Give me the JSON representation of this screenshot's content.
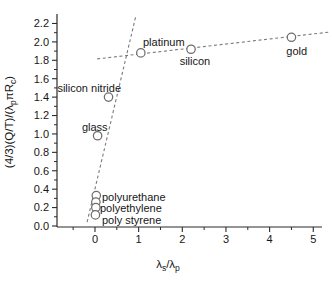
{
  "figure": {
    "background": "#ffffff"
  },
  "chart_data": {
    "type": "scatter",
    "title": "",
    "xlabel_parts": [
      {
        "t": "λ"
      },
      {
        "t": "s",
        "sub": true
      },
      {
        "t": "/λ"
      },
      {
        "t": "p",
        "sub": true
      }
    ],
    "ylabel_parts": [
      {
        "t": "(4/3)(Q/T)/(λ"
      },
      {
        "t": "p",
        "sub": true
      },
      {
        "t": "πR"
      },
      {
        "t": "c",
        "sub": true
      },
      {
        "t": ")"
      }
    ],
    "xlim": [
      -0.87,
      5.2
    ],
    "ylim": [
      -0.011,
      2.303
    ],
    "grid": false,
    "legend": false,
    "x_ticks": [
      {
        "v": 0,
        "label": "0"
      },
      {
        "v": 1,
        "label": "1"
      },
      {
        "v": 2,
        "label": "2"
      },
      {
        "v": 3,
        "label": "3"
      },
      {
        "v": 4,
        "label": "4"
      },
      {
        "v": 5,
        "label": "5"
      }
    ],
    "x_minor_ticks": [
      -0.5,
      0.5,
      1.5,
      2.5,
      3.5,
      4.5
    ],
    "y_ticks": [
      {
        "v": 0.0,
        "label": "0.0"
      },
      {
        "v": 0.2,
        "label": "0.2"
      },
      {
        "v": 0.4,
        "label": "0.4"
      },
      {
        "v": 0.6,
        "label": "0.6"
      },
      {
        "v": 0.8,
        "label": "0.8"
      },
      {
        "v": 1.0,
        "label": "1.0"
      },
      {
        "v": 1.2,
        "label": "1.2"
      },
      {
        "v": 1.4,
        "label": "1.4"
      },
      {
        "v": 1.6,
        "label": "1.6"
      },
      {
        "v": 1.8,
        "label": "1.8"
      },
      {
        "v": 2.0,
        "label": "2.0"
      },
      {
        "v": 2.2,
        "label": "2.2"
      }
    ],
    "y_minor_ticks": [
      0.1,
      0.3,
      0.5,
      0.7,
      0.9,
      1.1,
      1.3,
      1.5,
      1.7,
      1.9,
      2.1
    ],
    "points": [
      {
        "label": "platinum",
        "x": 1.05,
        "y": 1.88
      },
      {
        "label": "silicon",
        "x": 2.2,
        "y": 1.92
      },
      {
        "label": "gold",
        "x": 4.5,
        "y": 2.05
      },
      {
        "label": "silicon nitride",
        "x": 0.31,
        "y": 1.4
      },
      {
        "label": "glass",
        "x": 0.06,
        "y": 0.98
      },
      {
        "label": "polyurethane",
        "x": 0.03,
        "y": 0.33
      },
      {
        "label": "polyethylene",
        "x": 0.02,
        "y": 0.26
      },
      {
        "label": "polyethylene",
        "x": 0.02,
        "y": 0.2
      },
      {
        "label": "poly styrene",
        "x": 0.01,
        "y": 0.12
      }
    ],
    "annotations": [
      {
        "text": "platinum",
        "x": 1.1,
        "y": 1.956,
        "anchor": "start"
      },
      {
        "text": "silicon",
        "x": 2.29,
        "y": 1.749,
        "anchor": "middle"
      },
      {
        "text": "gold",
        "x": 4.62,
        "y": 1.858,
        "anchor": "middle"
      },
      {
        "text": "silicon nitride",
        "x": -0.86,
        "y": 1.456,
        "anchor": "start"
      },
      {
        "text": "glass",
        "x": -0.3,
        "y": 1.032,
        "anchor": "start"
      },
      {
        "text": "polyurethane",
        "x": 0.16,
        "y": 0.271,
        "anchor": "start"
      },
      {
        "text": "polyethylene",
        "x": 0.115,
        "y": 0.147,
        "anchor": "start"
      },
      {
        "text": "poly styrene",
        "x": 0.16,
        "y": 0.022,
        "anchor": "start"
      }
    ],
    "trend_lines": [
      {
        "name": "metals-trend",
        "x1": 0.05,
        "y1": 1.815,
        "x2": 5.39,
        "y2": 2.108,
        "style": "dashed"
      },
      {
        "name": "low-conductivity-trend",
        "x1": -0.18,
        "y1": 0.043,
        "x2": 0.94,
        "y2": 2.29,
        "style": "dashed"
      }
    ],
    "colors": {
      "point_stroke": "#6e6e6e",
      "point_fill": "#ffffff",
      "trend_line": "#7a7a7a",
      "axis": "#2b2b2b",
      "text": "#161616"
    }
  }
}
